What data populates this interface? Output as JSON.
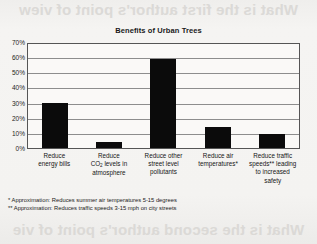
{
  "page": {
    "bleed_top": "What is the first author's point of view",
    "bleed_middle": "What is the author's main point here",
    "bleed_bottom": "What is the second author's point of vie"
  },
  "chart_data": {
    "type": "bar",
    "title": "Benefits of Urban Trees",
    "xlabel": "",
    "ylabel": "",
    "ylim": [
      0,
      70
    ],
    "grid": true,
    "legend": "none",
    "categories": [
      "Reduce energy bills",
      "Reduce CO2 levels in atmosphere",
      "Reduce other street level pollutants",
      "Reduce air temperatures*",
      "Reduce traffic speeds** leading to increased safety"
    ],
    "values": [
      30,
      4,
      59,
      14,
      9
    ],
    "ytick_labels": [
      "70%",
      "60%",
      "50%",
      "40%",
      "30%",
      "20%",
      "10%",
      "0%"
    ],
    "ytick_values": [
      70,
      60,
      50,
      40,
      30,
      20,
      10,
      0
    ],
    "bar_color": "#0b0b0b",
    "plot_background": "#faf9f7",
    "gridline_color": "#8d8d8d"
  },
  "axis_labels": [
    {
      "line1": "Reduce",
      "line2": "energy bills",
      "line3": "",
      "line4": ""
    },
    {
      "line1": "Reduce",
      "line2_pre": "CO",
      "line2_sub": "2",
      "line2_post": " levels in",
      "line3": "atmosphere",
      "line4": ""
    },
    {
      "line1": "Reduce other",
      "line2": "street level",
      "line3": "pollutants",
      "line4": ""
    },
    {
      "line1": "Reduce air",
      "line2": "temperatures*",
      "line3": "",
      "line4": ""
    },
    {
      "line1": "Reduce traffic",
      "line2": "speeds** leading",
      "line3": "to increased",
      "line4": "safety"
    }
  ],
  "footnotes": [
    "* Approximation: Reduces summer air temperatures 5-15 degrees",
    "** Approximation: Reduces traffic speeds 3-15 mph on city streets"
  ]
}
